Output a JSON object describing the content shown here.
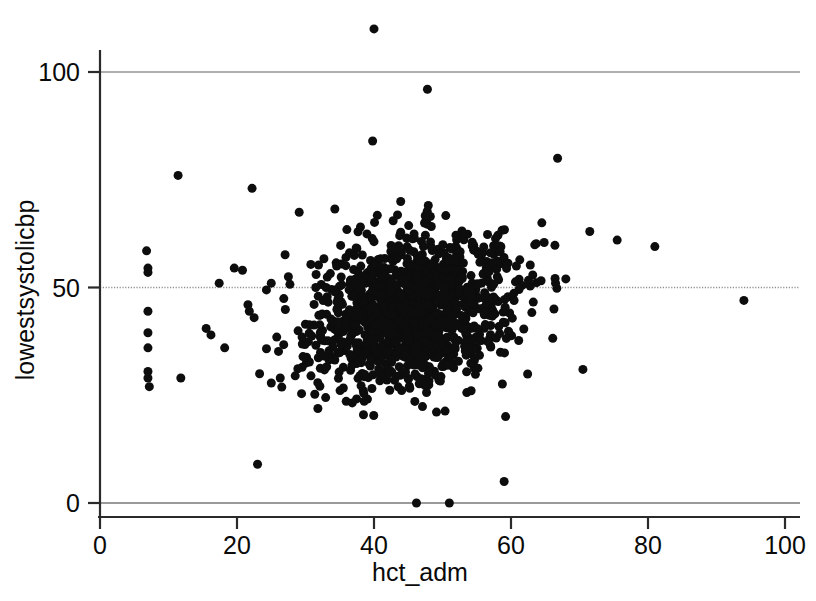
{
  "chart_data": {
    "type": "scatter",
    "title": "",
    "xlabel": "hct_adm",
    "ylabel": "lowestsystolicbp",
    "xlim": [
      0,
      100
    ],
    "ylim": [
      0,
      110
    ],
    "xticks": [
      0,
      20,
      40,
      60,
      80,
      100
    ],
    "yticks": [
      0,
      50,
      100
    ],
    "xtick_labels": [
      "0",
      "20",
      "40",
      "60",
      "80",
      "100"
    ],
    "ytick_labels": [
      "0",
      "50",
      "100"
    ],
    "grid": true,
    "gridlines": [
      {
        "y": 100,
        "style": "solid",
        "color": "#b0b0b0"
      },
      {
        "y": 50,
        "style": "dotted",
        "color": "#909090"
      },
      {
        "y": 0,
        "style": "solid",
        "color": "#9a9a9a"
      }
    ],
    "legend": null,
    "marker": {
      "shape": "circle",
      "color": "#0d0d0d",
      "size_px": 9
    },
    "n_points_approx": 1450,
    "cluster": {
      "center_x": 45.5,
      "center_y": 44.5,
      "sd_x": 7.0,
      "sd_y": 8.5,
      "n": 1380
    },
    "outliers": [
      {
        "x": 40.0,
        "y": 110.0
      },
      {
        "x": 47.8,
        "y": 96.0
      },
      {
        "x": 39.8,
        "y": 84.0
      },
      {
        "x": 11.4,
        "y": 76.0
      },
      {
        "x": 66.8,
        "y": 80.0
      },
      {
        "x": 22.2,
        "y": 73.0
      },
      {
        "x": 6.8,
        "y": 58.5
      },
      {
        "x": 7.0,
        "y": 54.5
      },
      {
        "x": 7.0,
        "y": 53.5
      },
      {
        "x": 7.0,
        "y": 44.5
      },
      {
        "x": 7.0,
        "y": 39.5
      },
      {
        "x": 7.0,
        "y": 36.0
      },
      {
        "x": 7.0,
        "y": 30.5
      },
      {
        "x": 7.0,
        "y": 29.0
      },
      {
        "x": 7.2,
        "y": 27.0
      },
      {
        "x": 11.8,
        "y": 29.0
      },
      {
        "x": 15.5,
        "y": 40.5
      },
      {
        "x": 16.2,
        "y": 39.0
      },
      {
        "x": 17.4,
        "y": 51.0
      },
      {
        "x": 18.2,
        "y": 36.0
      },
      {
        "x": 19.6,
        "y": 54.5
      },
      {
        "x": 20.8,
        "y": 54.0
      },
      {
        "x": 21.6,
        "y": 46.0
      },
      {
        "x": 21.8,
        "y": 44.5
      },
      {
        "x": 22.5,
        "y": 43.0
      },
      {
        "x": 23.3,
        "y": 30.0
      },
      {
        "x": 23.0,
        "y": 9.0
      },
      {
        "x": 25.0,
        "y": 51.0
      },
      {
        "x": 27.5,
        "y": 52.5
      },
      {
        "x": 25.8,
        "y": 38.5
      },
      {
        "x": 29.5,
        "y": 38.5
      },
      {
        "x": 28.5,
        "y": 29.5
      },
      {
        "x": 31.5,
        "y": 50.0
      },
      {
        "x": 33.0,
        "y": 50.0
      },
      {
        "x": 30.8,
        "y": 29.5
      },
      {
        "x": 59.0,
        "y": 5.0
      },
      {
        "x": 46.2,
        "y": 0.0
      },
      {
        "x": 51.0,
        "y": 0.0
      },
      {
        "x": 70.5,
        "y": 31.0
      },
      {
        "x": 71.5,
        "y": 63.0
      },
      {
        "x": 75.5,
        "y": 61.0
      },
      {
        "x": 81.0,
        "y": 59.5
      },
      {
        "x": 94.0,
        "y": 47.0
      },
      {
        "x": 68.0,
        "y": 52.0
      },
      {
        "x": 66.5,
        "y": 51.0
      },
      {
        "x": 64.5,
        "y": 65.0
      }
    ]
  },
  "axis": {
    "x_title": "hct_adm",
    "y_title": "lowestsystolicbp",
    "x_ticks": [
      "0",
      "20",
      "40",
      "60",
      "80",
      "100"
    ],
    "y_ticks": [
      "100",
      "50",
      "0"
    ]
  },
  "colors": {
    "marker": "#0d0d0d",
    "axis": "#2a2a2a",
    "grid_solid": "#b0b0b0",
    "grid_dotted": "#8f8f8f",
    "background": "#ffffff",
    "text": "#0a0a0a"
  }
}
